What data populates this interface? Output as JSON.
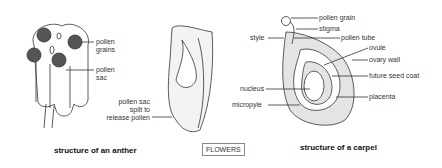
{
  "anther": {
    "labels": {
      "pollen_grains_1": "pollen",
      "pollen_grains_2": "grains",
      "pollen_sac_1": "pollen",
      "pollen_sac_2": "sac",
      "split_1": "pollen sac",
      "split_2": "split to",
      "split_3": "release pollen"
    },
    "caption": "structure of an anther"
  },
  "badge": "FLOWERS",
  "carpel": {
    "labels": {
      "pollen_grain": "pollen grain",
      "stigma": "stigma",
      "style": "style",
      "pollen_tube": "pollen tube",
      "ovule": "ovule",
      "ovary_wall": "ovary wall",
      "future_seed_coat": "future seed coat",
      "nucleus": "nucleus",
      "placenta": "placenta",
      "micropyle": "micropyle"
    },
    "caption": "structure of a carpel"
  }
}
